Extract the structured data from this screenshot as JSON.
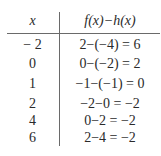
{
  "table": {
    "headers": [
      "x",
      "f(x)−h(x)"
    ],
    "rows": [
      {
        "x": "− 2",
        "value": "2−(−4) = 6"
      },
      {
        "x": "0",
        "value": "0−(−2) = 2"
      },
      {
        "x": "1",
        "value": "−1−(−1) = 0"
      },
      {
        "x": "2",
        "value": "−2−0 = −2"
      },
      {
        "x": "4",
        "value": "0−2 = −2"
      },
      {
        "x": "6",
        "value": "2−4 = −2"
      }
    ]
  }
}
